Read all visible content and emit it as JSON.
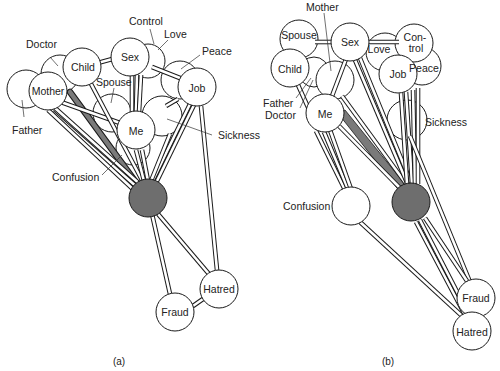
{
  "figure": {
    "panels": [
      {
        "caption": "(a)",
        "nodes": {
          "father": "Father",
          "mother": "Mother",
          "doctor": "Doctor",
          "child": "Child",
          "sex": "Sex",
          "love": "Love",
          "control": "Control",
          "peace": "Peace",
          "job": "Job",
          "spouse": "Spouse",
          "me": "Me",
          "sickness": "Sickness",
          "confusion": "Confusion",
          "hatred": "Hatred",
          "fraud": "Fraud"
        }
      },
      {
        "caption": "(b)",
        "nodes": {
          "mother": "Mother",
          "spouse": "Spouse",
          "sex": "Sex",
          "love": "Love",
          "control_line1": "Con-",
          "control_line2": "trol",
          "child": "Child",
          "job": "Job",
          "peace": "Peace",
          "father": "Father",
          "doctor": "Doctor",
          "me": "Me",
          "sickness": "Sickness",
          "confusion": "Confusion",
          "fraud": "Fraud",
          "hatred": "Hatred"
        }
      }
    ]
  },
  "colors": {
    "node_fill": "#ffffff",
    "dark_node_fill": "#6e6e6e",
    "outline": "#1a1a1a"
  }
}
